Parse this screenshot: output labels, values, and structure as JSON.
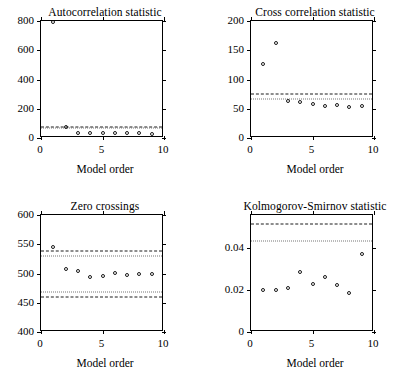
{
  "figure": {
    "width": 420,
    "height": 388,
    "background": "#ffffff",
    "marker_color": "#1a1a1a",
    "dashed_color": "#1a1a1a",
    "dotted_color": "#777777"
  },
  "panels": [
    {
      "key": "autocorrelation",
      "title": "Autocorrelation statistic",
      "xlabel": "Model order"
    },
    {
      "key": "cross_correlation",
      "title": "Cross correlation statistic",
      "xlabel": "Model order"
    },
    {
      "key": "zero_crossings",
      "title": "Zero crossings",
      "xlabel": "Model order"
    },
    {
      "key": "kolmogorov_smirnov",
      "title": "Kolmogorov-Smirnov statistic",
      "xlabel": "Model order"
    }
  ],
  "chart_data": [
    {
      "type": "scatter",
      "title": "Autocorrelation statistic",
      "xlabel": "Model order",
      "ylabel": "",
      "xlim": [
        0,
        10
      ],
      "ylim": [
        0,
        800
      ],
      "xticks": [
        0,
        5,
        10
      ],
      "xticklabels": [
        "0",
        "5",
        "10"
      ],
      "yticks": [
        0,
        200,
        400,
        600,
        800
      ],
      "yticklabels": [
        "0",
        "200",
        "400",
        "600",
        "800"
      ],
      "grid": false,
      "legend": "none",
      "x": [
        1,
        2,
        3,
        4,
        5,
        6,
        7,
        8,
        9,
        10
      ],
      "values": [
        793,
        72,
        37,
        34,
        36,
        33,
        34,
        32,
        30,
        31
      ],
      "marker": "open-circle",
      "last_point_filled": true,
      "reference_lines": [
        {
          "style": "dashed",
          "value": 73,
          "color": "#1a1a1a"
        },
        {
          "style": "dotted",
          "value": 66,
          "color": "#777777"
        }
      ]
    },
    {
      "type": "scatter",
      "title": "Cross correlation statistic",
      "xlabel": "Model order",
      "ylabel": "",
      "xlim": [
        0,
        10
      ],
      "ylim": [
        0,
        200
      ],
      "xticks": [
        0,
        5,
        10
      ],
      "xticklabels": [
        "0",
        "5",
        "10"
      ],
      "yticks": [
        0,
        50,
        100,
        150,
        200
      ],
      "yticklabels": [
        "0",
        "50",
        "100",
        "150",
        "200"
      ],
      "grid": false,
      "legend": "none",
      "x": [
        1,
        2,
        3,
        4,
        5,
        6,
        7,
        8,
        9,
        10
      ],
      "values": [
        127,
        163,
        63,
        61,
        58,
        55,
        56,
        53,
        55,
        55
      ],
      "marker": "open-circle",
      "last_point_filled": true,
      "reference_lines": [
        {
          "style": "dashed",
          "value": 76,
          "color": "#1a1a1a"
        },
        {
          "style": "dotted",
          "value": 67,
          "color": "#777777"
        }
      ]
    },
    {
      "type": "scatter",
      "title": "Zero crossings",
      "xlabel": "Model order",
      "ylabel": "",
      "xlim": [
        0,
        10
      ],
      "ylim": [
        400,
        600
      ],
      "xticks": [
        0,
        5,
        10
      ],
      "xticklabels": [
        "0",
        "5",
        "10"
      ],
      "yticks": [
        400,
        450,
        500,
        550,
        600
      ],
      "yticklabels": [
        "400",
        "450",
        "500",
        "550",
        "600"
      ],
      "grid": false,
      "legend": "none",
      "x": [
        1,
        2,
        3,
        4,
        5,
        6,
        7,
        8,
        9,
        10
      ],
      "values": [
        546,
        508,
        504,
        494,
        496,
        501,
        498,
        500,
        499,
        484
      ],
      "marker": "open-circle",
      "last_point_filled": true,
      "reference_lines": [
        {
          "style": "dashed",
          "value": 538,
          "color": "#1a1a1a"
        },
        {
          "style": "dotted",
          "value": 530,
          "color": "#777777"
        },
        {
          "style": "dotted",
          "value": 468,
          "color": "#777777"
        },
        {
          "style": "dashed",
          "value": 459,
          "color": "#1a1a1a"
        }
      ]
    },
    {
      "type": "scatter",
      "title": "Kolmogorov-Smirnov statistic",
      "xlabel": "Model order",
      "ylabel": "",
      "xlim": [
        0,
        10
      ],
      "ylim": [
        0,
        0.056
      ],
      "xticks": [
        0,
        5,
        10
      ],
      "xticklabels": [
        "0",
        "5",
        "10"
      ],
      "yticks": [
        0,
        0.02,
        0.04
      ],
      "yticklabels": [
        "0",
        "0.02",
        "0.04"
      ],
      "grid": false,
      "legend": "none",
      "x": [
        1,
        2,
        3,
        4,
        5,
        6,
        7,
        8,
        9,
        10
      ],
      "values": [
        0.0199,
        0.0203,
        0.0211,
        0.0285,
        0.0231,
        0.0263,
        0.0224,
        0.0185,
        0.0374,
        0.0229
      ],
      "marker": "open-circle",
      "last_point_filled": true,
      "reference_lines": [
        {
          "style": "dashed",
          "value": 0.0515,
          "color": "#1a1a1a"
        },
        {
          "style": "dotted",
          "value": 0.0435,
          "color": "#777777"
        }
      ]
    }
  ]
}
